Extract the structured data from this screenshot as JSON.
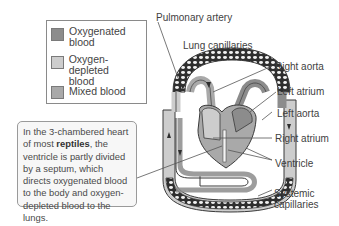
{
  "legend": {
    "items": [
      {
        "label": "Oxygenated blood",
        "line1": "Oxygenated",
        "line2": "blood",
        "color": "#8c8c8c"
      },
      {
        "label": "Oxygen-depleted blood",
        "line1": "Oxygen-depleted",
        "line2": "blood",
        "color": "#cdcdcd"
      },
      {
        "label": "Mixed blood",
        "line1": "Mixed blood",
        "line2": "",
        "color": "#a9a9a9"
      }
    ]
  },
  "callout": {
    "pre": "In the  3-chambered heart of most ",
    "bold": "reptiles",
    "post": ", the ventricle is partly divided by a septum, which directs oxygenated blood to the body and oxygen-depleted blood to the lungs."
  },
  "labels": {
    "pulmonary_artery": "Pulmonary artery",
    "lung_capillaries": "Lung capillaries",
    "right_aorta": "Right aorta",
    "left_atrium": "Left atrium",
    "left_aorta": "Left aorta",
    "right_atrium": "Right atrium",
    "ventricle": "Ventricle",
    "systemic_capillaries_line1": "Systemic",
    "systemic_capillaries_line2": "capillaries"
  },
  "colors": {
    "oxygenated": "#8c8c8c",
    "depleted": "#cdcdcd",
    "mixed": "#a9a9a9",
    "outline": "#3a3a3a"
  }
}
